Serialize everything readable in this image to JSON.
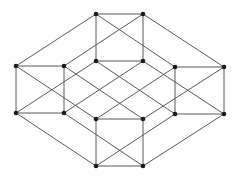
{
  "diagram": {
    "type": "graph",
    "node_color": "#1a1a1a",
    "edge_color": "#5a5a5a",
    "nodes": [
      {
        "id": "A",
        "x": 96,
        "y": 14
      },
      {
        "id": "B",
        "x": 143,
        "y": 14
      },
      {
        "id": "C",
        "x": 96,
        "y": 61
      },
      {
        "id": "D",
        "x": 143,
        "y": 61
      },
      {
        "id": "E",
        "x": 16,
        "y": 66
      },
      {
        "id": "F",
        "x": 64,
        "y": 66
      },
      {
        "id": "G",
        "x": 175,
        "y": 67
      },
      {
        "id": "H",
        "x": 224,
        "y": 67
      },
      {
        "id": "I",
        "x": 16,
        "y": 113
      },
      {
        "id": "J",
        "x": 64,
        "y": 113
      },
      {
        "id": "K",
        "x": 175,
        "y": 114
      },
      {
        "id": "L",
        "x": 224,
        "y": 114
      },
      {
        "id": "M",
        "x": 96,
        "y": 119
      },
      {
        "id": "N",
        "x": 143,
        "y": 119
      },
      {
        "id": "O",
        "x": 96,
        "y": 166
      },
      {
        "id": "P",
        "x": 143,
        "y": 166
      }
    ],
    "edges": [
      [
        "A",
        "B"
      ],
      [
        "A",
        "C"
      ],
      [
        "B",
        "D"
      ],
      [
        "C",
        "D"
      ],
      [
        "E",
        "F"
      ],
      [
        "E",
        "I"
      ],
      [
        "F",
        "J"
      ],
      [
        "I",
        "J"
      ],
      [
        "G",
        "H"
      ],
      [
        "G",
        "K"
      ],
      [
        "H",
        "L"
      ],
      [
        "K",
        "L"
      ],
      [
        "M",
        "N"
      ],
      [
        "M",
        "O"
      ],
      [
        "N",
        "P"
      ],
      [
        "O",
        "P"
      ],
      [
        "A",
        "E"
      ],
      [
        "B",
        "H"
      ],
      [
        "I",
        "O"
      ],
      [
        "L",
        "P"
      ],
      [
        "A",
        "G"
      ],
      [
        "B",
        "F"
      ],
      [
        "O",
        "K"
      ],
      [
        "P",
        "J"
      ],
      [
        "E",
        "M"
      ],
      [
        "I",
        "C"
      ],
      [
        "F",
        "N"
      ],
      [
        "J",
        "D"
      ],
      [
        "C",
        "K"
      ],
      [
        "D",
        "L"
      ],
      [
        "G",
        "M"
      ],
      [
        "H",
        "N"
      ]
    ]
  }
}
